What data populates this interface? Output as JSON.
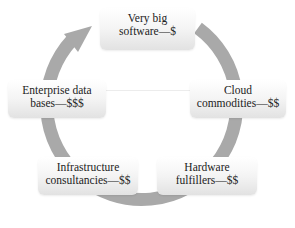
{
  "diagram": {
    "type": "cycle",
    "ring_color": "#a9a9a9",
    "direction": "clockwise",
    "nodes": [
      {
        "id": "very-big-software",
        "line1": "Very big",
        "line2": "software—$"
      },
      {
        "id": "cloud-commodities",
        "line1": "Cloud",
        "line2": "commodities—$$"
      },
      {
        "id": "hardware-fulfillers",
        "line1": "Hardware",
        "line2": "fulfillers—$$"
      },
      {
        "id": "infrastructure-consultancies",
        "line1": "Infrastructure",
        "line2": "consultancies—$$"
      },
      {
        "id": "enterprise-databases",
        "line1": "Enterprise data",
        "line2": "bases—$$$"
      }
    ]
  }
}
